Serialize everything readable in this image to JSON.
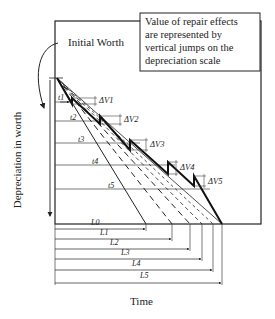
{
  "diagram": {
    "callout": {
      "lines": [
        "Value of repair effects",
        "are represented by",
        "vertical jumps on the",
        "depreciation scale"
      ]
    },
    "initial_worth_label": "Initial Worth",
    "y_axis_label": "Depreciation in worth",
    "x_axis_label": "Time",
    "interval_labels": [
      "t1",
      "t2",
      "t3",
      "t4",
      "t5"
    ],
    "repair_jumps": [
      "ΔV1",
      "ΔV2",
      "ΔV3",
      "ΔV4",
      "ΔV5"
    ],
    "life_labels": [
      "L0",
      "L1",
      "L2",
      "L3",
      "L4",
      "L5"
    ]
  }
}
